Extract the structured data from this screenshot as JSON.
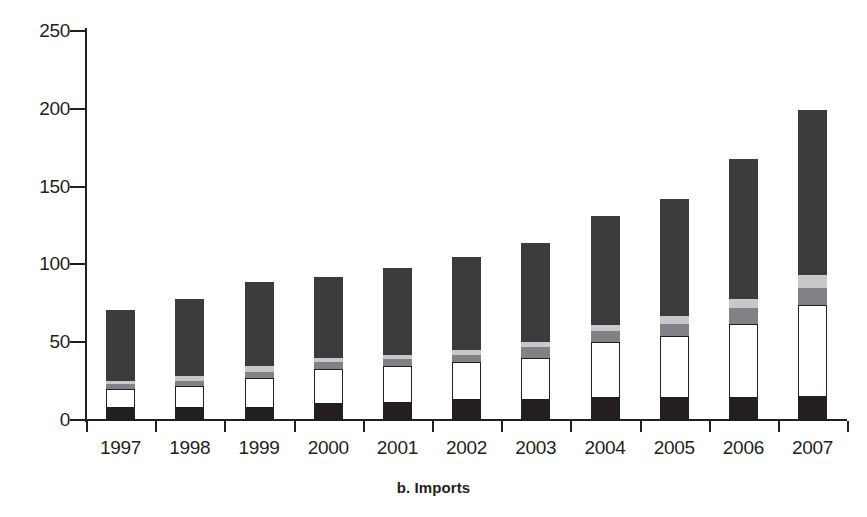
{
  "chart_data": {
    "type": "bar",
    "subtype": "stacked",
    "title": "",
    "caption": "b. Imports",
    "xlabel": "",
    "ylabel": "",
    "ylim": [
      0,
      250
    ],
    "yticks": [
      0,
      50,
      100,
      150,
      200,
      250
    ],
    "ytick_labels": [
      "0",
      "50",
      "100",
      "150",
      "200",
      "250"
    ],
    "grid": false,
    "legend": "none",
    "categories": [
      "1997",
      "1998",
      "1999",
      "2000",
      "2001",
      "2002",
      "2003",
      "2004",
      "2005",
      "2006",
      "2007"
    ],
    "series": [
      {
        "name": "segment-1-dark-bottom",
        "color": "#231f20",
        "values": [
          8,
          8,
          8,
          10,
          11,
          13,
          13,
          14,
          14,
          14,
          15
        ]
      },
      {
        "name": "segment-2-white",
        "color": "#ffffff",
        "values": [
          12,
          14,
          19,
          23,
          24,
          24,
          27,
          36,
          40,
          48,
          59
        ]
      },
      {
        "name": "segment-3-medium-gray",
        "color": "#808285",
        "values": [
          3,
          3,
          4,
          4,
          4,
          5,
          7,
          7,
          8,
          10,
          11
        ]
      },
      {
        "name": "segment-4-light-gray",
        "color": "#c7c8ca",
        "values": [
          2,
          3,
          4,
          3,
          3,
          3,
          3,
          4,
          5,
          6,
          8
        ]
      },
      {
        "name": "segment-5-dark-top",
        "color": "#3b3a3c",
        "values": [
          46,
          50,
          54,
          52,
          56,
          60,
          64,
          70,
          75,
          90,
          106
        ]
      }
    ],
    "totals": [
      71,
      78,
      89,
      92,
      98,
      105,
      114,
      131,
      142,
      168,
      199
    ]
  }
}
